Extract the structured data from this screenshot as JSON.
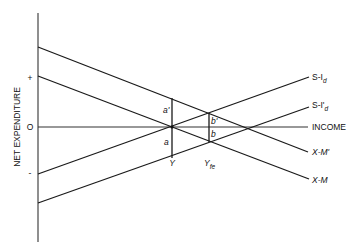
{
  "diagram": {
    "y_axis_label": "NET EXPENDITURE",
    "y_signs": {
      "plus": "+",
      "zero": "O",
      "minus": "-"
    },
    "x_axis_label": "INCOME",
    "curves": [
      {
        "name": "S-Id",
        "label_main": "S-I",
        "label_sub": "d",
        "start": [
          38,
          174
        ],
        "end": [
          309,
          77
        ]
      },
      {
        "name": "S-I'd",
        "label_main": "S-I'",
        "label_sub": "d",
        "start": [
          38,
          203
        ],
        "end": [
          309,
          107
        ]
      },
      {
        "name": "X-M'",
        "label_main": "X-M'",
        "start": [
          38,
          47
        ],
        "end": [
          308,
          152
        ]
      },
      {
        "name": "X-M",
        "label_main": "X-M",
        "start": [
          38,
          76
        ],
        "end": [
          309,
          179
        ]
      }
    ],
    "markers": {
      "Y": {
        "label": "Y",
        "x": 172
      },
      "Yfe": {
        "label_main": "Y",
        "label_sub": "fe",
        "x": 209
      }
    },
    "segments": {
      "a_prime": "a'",
      "a": "a",
      "b_prime": "b'",
      "b": "b"
    }
  }
}
